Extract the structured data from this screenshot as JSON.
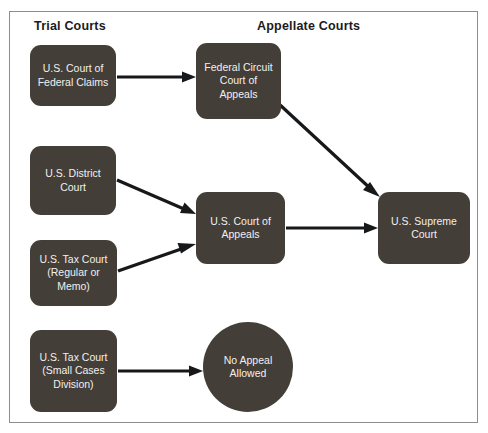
{
  "diagram": {
    "background_color": "#ffffff",
    "frame_border_color": "#8b8d90",
    "node_fill_color": "#433e38",
    "node_text_color": "#f2f0ed",
    "arrow_color": "#17181a"
  },
  "headings": {
    "trial": "Trial Courts",
    "appellate": "Appellate Courts"
  },
  "nodes": {
    "court_of_federal_claims": {
      "label": "U.S. Court of Federal Claims",
      "shape": "rounded-rect",
      "column": "trial"
    },
    "district_court": {
      "label": "U.S. District Court",
      "shape": "rounded-rect",
      "column": "trial"
    },
    "tax_court_regular": {
      "label": "U.S. Tax Court (Regular or Memo)",
      "shape": "rounded-rect",
      "column": "trial"
    },
    "tax_court_small": {
      "label": "U.S. Tax Court (Small Cases Division)",
      "shape": "rounded-rect",
      "column": "trial"
    },
    "federal_circuit": {
      "label": "Federal Circuit Court of Appeals",
      "shape": "rounded-rect",
      "column": "appellate"
    },
    "court_of_appeals": {
      "label": "U.S. Court of Appeals",
      "shape": "rounded-rect",
      "column": "appellate"
    },
    "supreme_court": {
      "label": "U.S. Supreme Court",
      "shape": "rounded-rect",
      "column": "appellate"
    },
    "no_appeal": {
      "label": "No Appeal Allowed",
      "shape": "circle",
      "column": "appellate"
    }
  },
  "edges": [
    {
      "from": "court_of_federal_claims",
      "to": "federal_circuit",
      "style": "straight-horizontal"
    },
    {
      "from": "federal_circuit",
      "to": "supreme_court",
      "style": "diagonal-down-right"
    },
    {
      "from": "district_court",
      "to": "court_of_appeals",
      "style": "diagonal-down-right"
    },
    {
      "from": "tax_court_regular",
      "to": "court_of_appeals",
      "style": "diagonal-up-right"
    },
    {
      "from": "court_of_appeals",
      "to": "supreme_court",
      "style": "straight-horizontal"
    },
    {
      "from": "tax_court_small",
      "to": "no_appeal",
      "style": "straight-horizontal"
    }
  ]
}
